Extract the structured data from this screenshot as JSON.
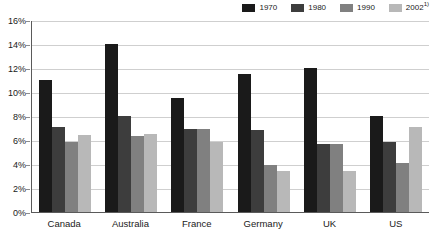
{
  "chart_data": {
    "type": "bar",
    "title": "",
    "subtitle": "",
    "xlabel": "",
    "ylabel": "",
    "ylim": [
      0,
      16
    ],
    "ytick_values": [
      0,
      2,
      4,
      6,
      8,
      10,
      12,
      14,
      16
    ],
    "ytick_labels": [
      "0%",
      "2%",
      "4%",
      "6%",
      "8%",
      "10%",
      "12%",
      "14%",
      "16%"
    ],
    "grid": true,
    "legend_position": "top-right",
    "categories": [
      "Canada",
      "Australia",
      "France",
      "Germany",
      "UK",
      "US"
    ],
    "series": [
      {
        "name": "1970",
        "color": "#1a1a1a",
        "values": [
          11.0,
          14.0,
          9.5,
          11.5,
          12.0,
          8.0
        ]
      },
      {
        "name": "1980",
        "color": "#3d3d3d",
        "values": [
          7.1,
          8.0,
          6.9,
          6.8,
          5.7,
          5.8
        ]
      },
      {
        "name": "1990",
        "color": "#808080",
        "values": [
          5.8,
          6.3,
          6.9,
          3.9,
          5.7,
          4.1
        ]
      },
      {
        "name": "2002",
        "name_display": "2002",
        "name_superscript": "1)",
        "color": "#b8b8b8",
        "values": [
          6.4,
          6.5,
          5.8,
          3.4,
          3.4,
          7.1
        ]
      }
    ]
  },
  "colors": {
    "axis": "#5a5a5a",
    "gridline": "#cfcfcf",
    "background": "#ffffff",
    "text": "#1a1a1a"
  }
}
